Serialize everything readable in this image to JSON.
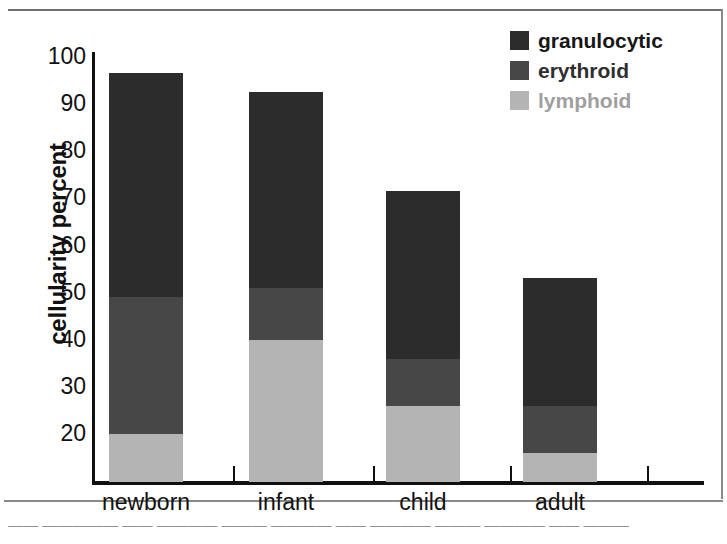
{
  "chart_data": {
    "type": "bar",
    "subtype": "stacked-bar",
    "title": "",
    "xlabel": "",
    "ylabel": "cellularity percent",
    "categories": [
      "newborn",
      "infant",
      "child",
      "adult"
    ],
    "ylim": [
      10,
      100
    ],
    "yticks": [
      20,
      30,
      40,
      50,
      60,
      70,
      80,
      90,
      100
    ],
    "ytick_labels": [
      "20",
      "30",
      "40",
      "50",
      "60",
      "70",
      "80",
      "90",
      "100"
    ],
    "grid": false,
    "legend_position": "top-right",
    "stack_order_bottom_to_top": [
      "lymphoid",
      "erythroid",
      "granulocytic"
    ],
    "series": [
      {
        "name": "lymphoid",
        "color": "#b4b4b4",
        "values": [
          20,
          40,
          26,
          16
        ],
        "cumulative_tops": [
          20,
          40,
          26,
          16
        ]
      },
      {
        "name": "erythroid",
        "color": "#474747",
        "values": [
          29,
          11,
          10,
          10
        ],
        "cumulative_tops": [
          49,
          51,
          36,
          26
        ]
      },
      {
        "name": "granulocytic",
        "color": "#2c2c2c",
        "values": [
          47.5,
          41.5,
          35.5,
          27
        ],
        "cumulative_tops": [
          96.5,
          92.5,
          71.5,
          53
        ]
      }
    ],
    "bar_totals": [
      96.5,
      92.5,
      71.5,
      53
    ]
  },
  "legend": {
    "items": [
      {
        "label": "granulocytic",
        "color": "#2c2c2c"
      },
      {
        "label": "erythroid",
        "color": "#474747"
      },
      {
        "label": "lymphoid",
        "color": "#b4b4b4"
      }
    ]
  },
  "caption": "—— ————— —— ———— ——— ———— —— ———— ——— ———— —— ———"
}
